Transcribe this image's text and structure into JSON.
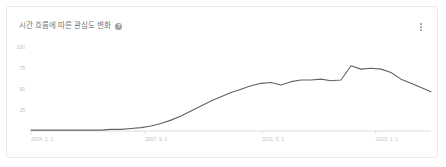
{
  "card": {
    "title": "시간 흐름에 따른 관심도 변화",
    "help_icon": "help-circle-icon",
    "menu_icon": "more-vert-icon"
  },
  "chart_data": {
    "type": "line",
    "title": "시간 흐름에 따른 관심도 변화",
    "xlabel": "",
    "ylabel": "",
    "grid": false,
    "legend": null,
    "line_color": "#5f6368",
    "ylim": [
      0,
      110
    ],
    "yticks": [
      100,
      75,
      50,
      25
    ],
    "ytick_labels": [
      "100",
      "75",
      "50",
      "25"
    ],
    "xticks": [
      "2004. 1. 1",
      "2007. 9. 1",
      "2011. 5. 1",
      "2015. 1. 1"
    ],
    "xtick_positions": [
      0,
      0.285,
      0.578,
      0.862
    ],
    "x": [
      "2004-01",
      "2004-07",
      "2005-01",
      "2005-07",
      "2006-01",
      "2006-07",
      "2007-01",
      "2007-07",
      "2008-01",
      "2008-07",
      "2009-01",
      "2009-07",
      "2010-01",
      "2010-04",
      "2010-07",
      "2010-10",
      "2011-01",
      "2011-04",
      "2011-07",
      "2011-10",
      "2012-01",
      "2012-04",
      "2012-07",
      "2012-10",
      "2013-01",
      "2013-04",
      "2013-07",
      "2013-10",
      "2014-01",
      "2014-04",
      "2014-07",
      "2014-10",
      "2015-01",
      "2015-04",
      "2015-07",
      "2015-10",
      "2016-01",
      "2016-07",
      "2017-01",
      "2017-07",
      "2018-01"
    ],
    "values": [
      1,
      1,
      1,
      1,
      1,
      1,
      1,
      1,
      2,
      2,
      3,
      4,
      6,
      9,
      13,
      18,
      24,
      30,
      36,
      41,
      46,
      50,
      54,
      57,
      58,
      55,
      59,
      61,
      61,
      62,
      60,
      61,
      78,
      74,
      75,
      74,
      70,
      62,
      57,
      52,
      47
    ],
    "peak": {
      "x": "2015-01",
      "value": 78
    },
    "annotations": []
  }
}
